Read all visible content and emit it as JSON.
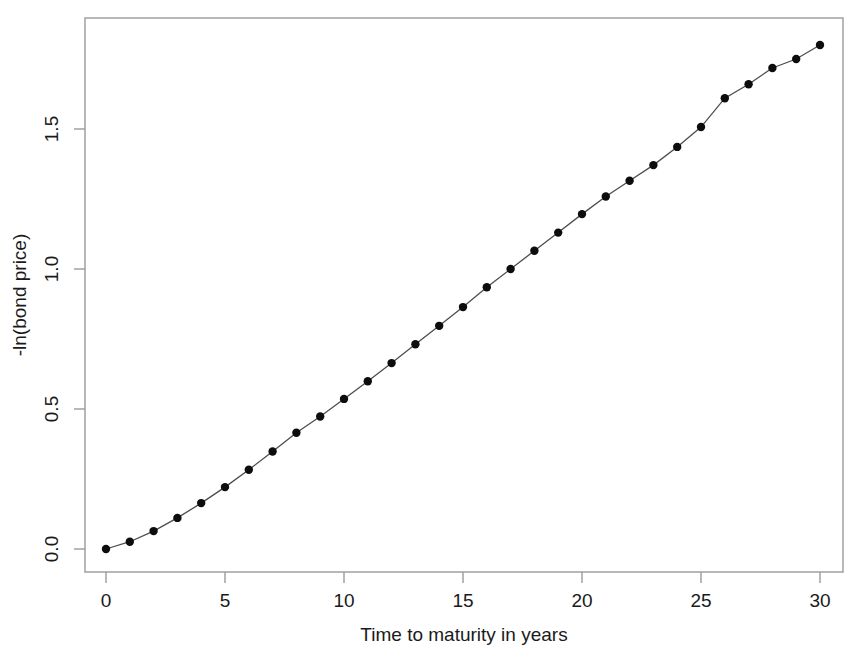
{
  "chart_data": {
    "type": "line",
    "title": "",
    "subtitle": "",
    "xlabel": "Time to maturity in years",
    "ylabel": "-ln(bond price)",
    "xlim": [
      -1.0,
      31.0
    ],
    "ylim": [
      -0.08,
      1.9
    ],
    "xticks": [
      0,
      5,
      10,
      15,
      20,
      25,
      30
    ],
    "xtick_labels": [
      "0",
      "5",
      "10",
      "15",
      "20",
      "25",
      "30"
    ],
    "yticks": [
      0.0,
      0.5,
      1.0,
      1.5
    ],
    "ytick_labels": [
      "0.0",
      "0.5",
      "1.0",
      "1.5"
    ],
    "grid": false,
    "legend": null,
    "legend_position": "none",
    "marker": "filled-circle",
    "marker_color": "#0d0d0d",
    "line_color": "#4d4d4d",
    "frame_color": "#9a9a9a",
    "series": [
      {
        "name": "-ln(bond price)",
        "x": [
          0,
          1,
          2,
          3,
          4,
          5,
          6,
          7,
          8,
          9,
          10,
          11,
          12,
          13,
          14,
          15,
          16,
          17,
          18,
          19,
          20,
          21,
          22,
          23,
          24,
          25,
          26,
          27,
          28,
          29,
          30
        ],
        "values": [
          0.0,
          0.026,
          0.064,
          0.111,
          0.164,
          0.221,
          0.283,
          0.348,
          0.415,
          0.473,
          0.536,
          0.599,
          0.664,
          0.731,
          0.797,
          0.864,
          0.935,
          1.0,
          1.065,
          1.13,
          1.196,
          1.259,
          1.315,
          1.371,
          1.436,
          1.507,
          1.61,
          1.66,
          1.718,
          1.75,
          1.8
        ]
      }
    ]
  },
  "axes": {
    "x_label": "Time to maturity in years",
    "y_label": "-ln(bond price)"
  }
}
